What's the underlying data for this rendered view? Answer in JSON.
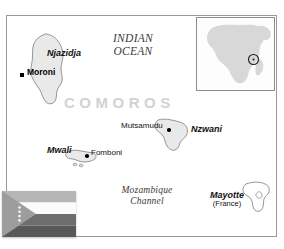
{
  "map": {
    "title": "COMOROS",
    "ocean_label_line1": "INDIAN",
    "ocean_label_line2": "OCEAN",
    "channel_label_line1": "Mozambique",
    "channel_label_line2": "Channel",
    "islands": [
      {
        "name": "Njazidja"
      },
      {
        "name": "Mwali"
      },
      {
        "name": "Nzwani"
      }
    ],
    "cities": [
      {
        "name": "Moroni",
        "type": "capital",
        "marker": "square-marker"
      },
      {
        "name": "Fomboni",
        "type": "city",
        "marker": "dot-marker"
      },
      {
        "name": "Mutsamudu",
        "type": "city",
        "marker": "dot-marker"
      }
    ],
    "territories": [
      {
        "name": "Mayotte",
        "sovereign": "(France)"
      }
    ],
    "colors": {
      "land_fill": "#e9e9e9",
      "land_stroke": "#8a8a8a",
      "water": "#ffffff",
      "frame": "#9a9a9a",
      "title": "#d2d2d2",
      "inset_land": "#d8d8d8"
    }
  },
  "inset": {
    "name": "africa-locator-inset",
    "continent": "Africa",
    "locator_marker": "circle-locator-icon"
  },
  "flag": {
    "name": "comoros-flag",
    "bands": [
      "yellow",
      "white",
      "red",
      "blue"
    ],
    "emblem": "crescent-and-four-stars",
    "star_count": 4
  }
}
